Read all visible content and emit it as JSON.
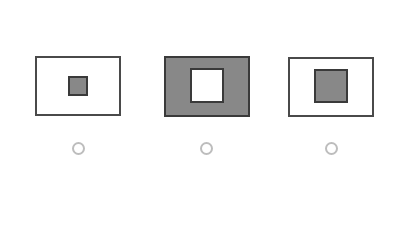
{
  "question": {
    "options": [
      {
        "id": "option-1",
        "description": "White rectangle with small gray square in center",
        "outer": {
          "x": 35,
          "y": 56,
          "w": 86,
          "h": 60,
          "fill": "#ffffff",
          "border": "#4a4a4a"
        },
        "inner": {
          "x": 68,
          "y": 76,
          "w": 20,
          "h": 20,
          "fill": "#888888",
          "border": "#3a3a3a"
        },
        "radio": {
          "cx": 78,
          "cy": 148,
          "selected": false
        }
      },
      {
        "id": "option-2",
        "description": "Gray rectangle with white square in center",
        "outer": {
          "x": 164,
          "y": 56,
          "w": 86,
          "h": 61,
          "fill": "#888888",
          "border": "#3a3a3a"
        },
        "inner": {
          "x": 190,
          "y": 68,
          "w": 34,
          "h": 35,
          "fill": "#ffffff",
          "border": "#3a3a3a"
        },
        "radio": {
          "cx": 206,
          "cy": 148,
          "selected": false
        }
      },
      {
        "id": "option-3",
        "description": "White rectangle with large gray square in center",
        "outer": {
          "x": 288,
          "y": 57,
          "w": 86,
          "h": 60,
          "fill": "#ffffff",
          "border": "#4a4a4a"
        },
        "inner": {
          "x": 314,
          "y": 69,
          "w": 34,
          "h": 34,
          "fill": "#888888",
          "border": "#3a3a3a"
        },
        "radio": {
          "cx": 331,
          "cy": 148,
          "selected": false
        }
      }
    ]
  },
  "colors": {
    "background": "#ffffff",
    "shape_border": "#4a4a4a",
    "shape_fill_gray": "#888888",
    "radio_border": "#bdbdbd"
  }
}
